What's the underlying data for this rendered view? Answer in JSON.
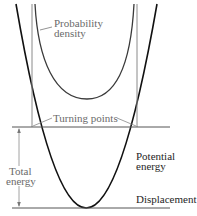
{
  "diagram": {
    "type": "quantum harmonic oscillator energy diagram",
    "labels": {
      "probability_density_line1": "Probability",
      "probability_density_line2": "density",
      "turning_points": "Turning points",
      "total_energy_line1": "Total",
      "total_energy_line2": "energy",
      "potential_energy_line1": "Potential",
      "potential_energy_line2": "energy",
      "displacement": "Displacement"
    },
    "colors": {
      "potential_curve": "#111111",
      "probability_curve": "#3a3a3a",
      "guide_lines": "#8a8a8a",
      "energy_line": "#555555",
      "label_grey": "#6a6a6a",
      "label_dark": "#1e1e1e",
      "background": "#ffffff"
    }
  }
}
